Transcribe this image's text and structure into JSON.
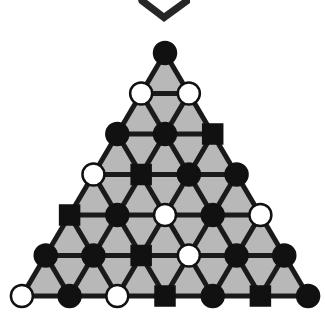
{
  "figure": {
    "canvas": {
      "width": 325,
      "height": 318
    },
    "colors": {
      "background": "#ffffff",
      "triangle_fill": "#b8b8b8",
      "edge_stroke": "#1a1a1a",
      "node_black": "#111111",
      "node_white": "#ffffff",
      "node_outline": "#111111",
      "chevron": "#262626"
    },
    "marker": {
      "name": "chevron-down-marker",
      "points": "138,0 139,3 164,22 190,3 190,0 182,0 164,13 147,0",
      "label": "v-chevron"
    },
    "geometry": {
      "apex_x": 165,
      "apex_y": 53,
      "row_step_y": 40.5,
      "col_step_x": 47.7,
      "rows": 7,
      "node_radius": 11,
      "square_size": 19,
      "edge_width": 5
    },
    "legend": {
      "black_circle": "filled-circle",
      "white_circle": "open-circle",
      "black_square": "filled-square"
    },
    "counts": {
      "total_nodes": 28,
      "black_circles": 16,
      "white_circles": 8,
      "black_squares": 6
    }
  },
  "chart_data": {
    "type": "diagram",
    "xlabel": "",
    "ylabel": "",
    "rows": [
      {
        "index": 1,
        "nodes": [
          {
            "shape": "circle",
            "fill": "black"
          }
        ]
      },
      {
        "index": 2,
        "nodes": [
          {
            "shape": "circle",
            "fill": "white"
          },
          {
            "shape": "circle",
            "fill": "white"
          }
        ]
      },
      {
        "index": 3,
        "nodes": [
          {
            "shape": "circle",
            "fill": "black"
          },
          {
            "shape": "circle",
            "fill": "black"
          },
          {
            "shape": "square",
            "fill": "black"
          }
        ]
      },
      {
        "index": 4,
        "nodes": [
          {
            "shape": "circle",
            "fill": "white"
          },
          {
            "shape": "square",
            "fill": "black"
          },
          {
            "shape": "circle",
            "fill": "black"
          },
          {
            "shape": "circle",
            "fill": "black"
          }
        ]
      },
      {
        "index": 5,
        "nodes": [
          {
            "shape": "square",
            "fill": "black"
          },
          {
            "shape": "circle",
            "fill": "black"
          },
          {
            "shape": "circle",
            "fill": "white"
          },
          {
            "shape": "circle",
            "fill": "black"
          },
          {
            "shape": "circle",
            "fill": "white"
          }
        ]
      },
      {
        "index": 6,
        "nodes": [
          {
            "shape": "circle",
            "fill": "black"
          },
          {
            "shape": "circle",
            "fill": "black"
          },
          {
            "shape": "square",
            "fill": "black"
          },
          {
            "shape": "circle",
            "fill": "white"
          },
          {
            "shape": "circle",
            "fill": "black"
          },
          {
            "shape": "circle",
            "fill": "black"
          }
        ]
      },
      {
        "index": 7,
        "nodes": [
          {
            "shape": "circle",
            "fill": "white"
          },
          {
            "shape": "circle",
            "fill": "black"
          },
          {
            "shape": "circle",
            "fill": "white"
          },
          {
            "shape": "square",
            "fill": "black"
          },
          {
            "shape": "circle",
            "fill": "black"
          },
          {
            "shape": "square",
            "fill": "black"
          },
          {
            "shape": "circle",
            "fill": "black"
          }
        ]
      }
    ]
  }
}
